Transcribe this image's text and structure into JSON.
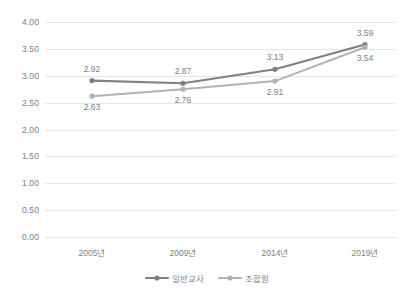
{
  "chart_data": {
    "type": "line",
    "title": "",
    "xlabel": "",
    "ylabel": "",
    "categories": [
      "2005년",
      "2009년",
      "2014년",
      "2019년"
    ],
    "ylim": [
      0.0,
      4.0
    ],
    "ytick_step": 0.5,
    "ytick_labels": [
      "4.00",
      "3.50",
      "3.00",
      "2.50",
      "2.00",
      "1.50",
      "1.00",
      "0.50",
      "0.00"
    ],
    "ytick_values": [
      4.0,
      3.5,
      3.0,
      2.5,
      2.0,
      1.5,
      1.0,
      0.5,
      0.0
    ],
    "grid": true,
    "legend_position": "bottom",
    "series": [
      {
        "name": "일반교사",
        "color": "#808080",
        "marker": "circle",
        "label_position": "above",
        "values": [
          2.92,
          2.87,
          3.13,
          3.59
        ],
        "value_labels": [
          "2.92",
          "2.87",
          "3.13",
          "3.59"
        ]
      },
      {
        "name": "조합원",
        "color": "#b3b3b3",
        "marker": "circle",
        "label_position": "below",
        "values": [
          2.63,
          2.76,
          2.91,
          3.54
        ],
        "value_labels": [
          "2.63",
          "2.76",
          "2.91",
          "3.54"
        ]
      }
    ]
  },
  "legend": {
    "items": [
      {
        "label": "일반교사",
        "color": "#808080"
      },
      {
        "label": "조합원",
        "color": "#b3b3b3"
      }
    ]
  },
  "colors": {
    "background": "#ffffff",
    "gridline": "#e6e6e6",
    "text": "#808080",
    "series1": "#808080",
    "series2": "#b3b3b3"
  }
}
